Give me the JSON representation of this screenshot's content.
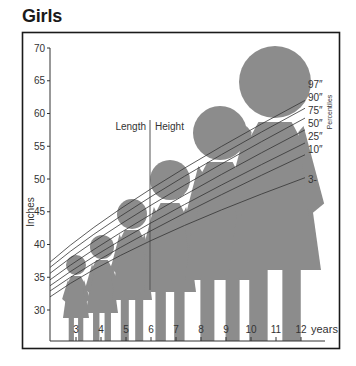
{
  "title": "Girls",
  "chart_data": {
    "type": "line",
    "title": "Girls",
    "xlabel": "years",
    "ylabel": "Inches",
    "legend_title": "Percentiles",
    "x": [
      2.5,
      6,
      12
    ],
    "xticks": [
      "3",
      "4",
      "5",
      "6",
      "7",
      "8",
      "9",
      "10",
      "11",
      "12"
    ],
    "yticks": [
      "30",
      "35",
      "40",
      "45",
      "50",
      "55",
      "60",
      "65",
      "70"
    ],
    "ylim": [
      28,
      70
    ],
    "xlim": [
      2,
      13
    ],
    "annotations": [
      "Length",
      "Height"
    ],
    "divider_age": 6,
    "series": [
      {
        "name": "97",
        "values": [
          37.3,
          48.5,
          62.0
        ]
      },
      {
        "name": "90",
        "values": [
          36.5,
          47.3,
          60.8
        ]
      },
      {
        "name": "75",
        "values": [
          35.6,
          46.0,
          59.3
        ]
      },
      {
        "name": "50",
        "values": [
          34.6,
          44.6,
          57.5
        ]
      },
      {
        "name": "25",
        "values": [
          33.7,
          43.3,
          55.5
        ]
      },
      {
        "name": "10",
        "values": [
          32.9,
          42.1,
          53.7
        ]
      },
      {
        "name": "3",
        "values": [
          32.0,
          40.6,
          50.2
        ]
      }
    ],
    "grid": false
  },
  "labels": {
    "percentiles": [
      "97",
      "90",
      "75",
      "50",
      "25",
      "10",
      "3"
    ],
    "length": "Length",
    "height": "Height",
    "years": "years",
    "inches": "Inches",
    "percentiles_title": "Percentiles"
  },
  "colors": {
    "figure": "#8c8c8c",
    "line": "#333333",
    "frame": "#1a1a1a"
  }
}
